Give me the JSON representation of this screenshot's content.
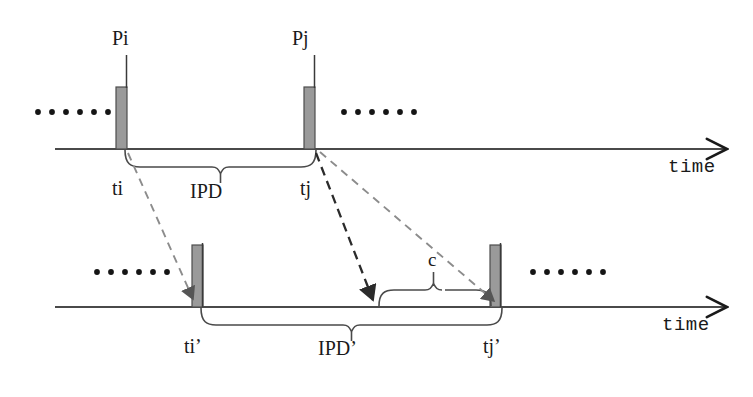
{
  "figure": {
    "type": "timing-diagram",
    "background_color": "#ffffff",
    "ink_color": "#1a1a1a",
    "pulse_fill_color": "#9a9a9a",
    "pulse_stroke_color": "#4d4d4d",
    "dashed_arrow_dark_color": "#2b2b2b",
    "dashed_arrow_light_color": "#8c8c8c"
  },
  "timelines": [
    {
      "id": "original",
      "axis_label": "time",
      "axis_y": 149,
      "axis_x_start": 55,
      "axis_x_end": 733,
      "ellipsis_left": {
        "dots": 6,
        "x": 35,
        "y": 112
      },
      "ellipsis_right": {
        "dots": 6,
        "x": 340,
        "y": 112
      },
      "pulses": [
        {
          "name": "Pi",
          "label": "Pi",
          "tick_label": "ti",
          "x": 122,
          "width": 11,
          "height": 62
        },
        {
          "name": "Pj",
          "label": "Pj",
          "tick_label": "tj",
          "x": 310,
          "width": 11,
          "height": 62
        }
      ],
      "brace": {
        "label": "IPD",
        "from_label": "ti",
        "to_label": "tj",
        "x_start": 127,
        "x_end": 315,
        "direction": "down"
      }
    },
    {
      "id": "watermarked",
      "axis_label": "time",
      "axis_y": 307,
      "axis_x_start": 55,
      "axis_x_end": 733,
      "ellipsis_left": {
        "dots": 6,
        "x": 95,
        "y": 272
      },
      "ellipsis_right": {
        "dots": 6,
        "x": 530,
        "y": 272
      },
      "pulses": [
        {
          "name": "Pi-prime",
          "label": "",
          "tick_label": "ti’",
          "x": 198,
          "width": 11,
          "height": 62
        },
        {
          "name": "Pj-prime",
          "label": "",
          "tick_label": "tj’",
          "x": 496,
          "width": 11,
          "height": 62
        }
      ],
      "brace": {
        "label": "IPD’",
        "from_label": "ti’",
        "to_label": "tj’",
        "x_start": 203,
        "x_end": 501,
        "direction": "down"
      },
      "offset_brace": {
        "label": "c",
        "x_start": 380,
        "x_end": 490,
        "direction": "up"
      }
    }
  ],
  "mappings": [
    {
      "name": "ti-to-ti-prime",
      "from": "ti",
      "to": "ti’",
      "style": "dashed",
      "weight": "light"
    },
    {
      "name": "tj-to-offset-start",
      "from": "tj",
      "to": "c-start",
      "style": "dashed",
      "weight": "bold"
    },
    {
      "name": "tj-to-tj-prime",
      "from": "tj",
      "to": "tj’",
      "style": "dashed",
      "weight": "light"
    }
  ],
  "labels": {
    "pulse_pi": "Pi",
    "pulse_pj": "Pj",
    "tick_ti": "ti",
    "tick_tj": "tj",
    "tick_ti_prime": "ti’",
    "tick_tj_prime": "tj’",
    "brace_ipd": "IPD",
    "brace_ipd_prime": "IPD’",
    "brace_c": "c",
    "axis_time_top": "time",
    "axis_time_bottom": "time"
  }
}
